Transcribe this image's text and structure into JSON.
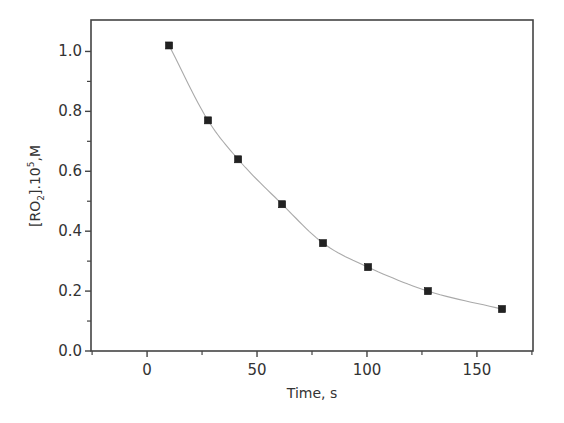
{
  "chart_data": {
    "type": "scatter",
    "title": "",
    "xlabel": "Time, s",
    "ylabel": "[RO2].10^5,M",
    "ylabel_parts": {
      "open": "[RO",
      "sub": "2",
      "mid": "].10",
      "sup": "5",
      "end": ",M"
    },
    "xlim": [
      -25.5,
      175.5
    ],
    "ylim": [
      0.0,
      1.105
    ],
    "x_ticks": [
      0,
      50,
      100,
      150
    ],
    "x_tick_labels": [
      "0",
      "50",
      "100",
      "150"
    ],
    "x_minor_ticks": [
      -25,
      25,
      75,
      125,
      175
    ],
    "y_ticks": [
      0.0,
      0.2,
      0.4,
      0.6,
      0.8,
      1.0
    ],
    "y_tick_labels": [
      "0.0",
      "0.2",
      "0.4",
      "0.6",
      "0.8",
      "1.0"
    ],
    "y_minor_ticks": [
      0.1,
      0.3,
      0.5,
      0.7,
      0.9
    ],
    "grid": false,
    "legend": null,
    "series": [
      {
        "name": "data",
        "marker": "square",
        "color": "#222222",
        "x": [
          10,
          27.7,
          41.4,
          61.4,
          80,
          100.5,
          127.7,
          161.4
        ],
        "y": [
          1.02,
          0.77,
          0.64,
          0.49,
          0.36,
          0.28,
          0.2,
          0.14
        ]
      },
      {
        "name": "fit",
        "type": "line",
        "color": "#aaaaaa",
        "model": "exponential decay y = y0 + A*exp(-t/tau)",
        "params": {
          "y0": 0.07,
          "A": 1.06,
          "tau": 70
        },
        "x_range": [
          10,
          161.4
        ]
      }
    ]
  }
}
